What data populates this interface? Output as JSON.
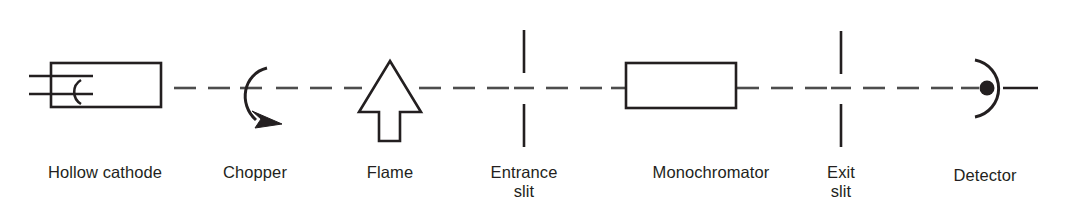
{
  "figure": {
    "background_color": "#ffffff",
    "stroke_color": "#231f20",
    "beam_color": "#4d4d4d",
    "width": 1067,
    "height": 208
  },
  "labels": {
    "hollow_cathode": "Hollow cathode",
    "chopper": "Chopper",
    "flame": "Flame",
    "entrance_slit": "Entrance\nslit",
    "monochromator": "Monochromator",
    "exit_slit": "Exit\nslit",
    "detector": "Detector"
  },
  "components": [
    {
      "name": "hollow-cathode-lamp",
      "label": "Hollow cathode",
      "icon": "rectangle-with-cathode-cup-and-two-leads",
      "order": 1
    },
    {
      "name": "chopper",
      "label": "Chopper",
      "icon": "rotating-arc-arrow",
      "order": 2
    },
    {
      "name": "flame",
      "label": "Flame",
      "icon": "up-arrow-outline",
      "order": 3
    },
    {
      "name": "entrance-slit",
      "label": "Entrance slit",
      "icon": "vertical-slit-pair",
      "order": 4
    },
    {
      "name": "monochromator",
      "label": "Monochromator",
      "icon": "open-rectangle",
      "order": 5
    },
    {
      "name": "exit-slit",
      "label": "Exit slit",
      "icon": "vertical-slit-pair",
      "order": 6
    },
    {
      "name": "detector",
      "label": "Detector",
      "icon": "semicircle-with-filled-dot",
      "order": 7
    }
  ],
  "beam": {
    "name": "optical-beam-path",
    "style": "dashed",
    "y": 88,
    "dash_length": 22,
    "gap_length": 12
  }
}
